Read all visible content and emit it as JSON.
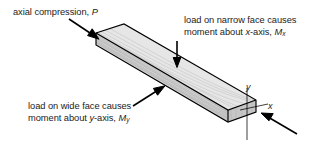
{
  "figure": {
    "background_color": "#ffffff",
    "line_color": "#000000",
    "top_face_color": "#e3e3e3",
    "front_face_color": "#d2d2d2",
    "end_face_color": "#c4c4c4",
    "grain_color": "#9a9a9a"
  },
  "labels": {
    "axial": {
      "line1_pre": "axial compression, ",
      "symbol": "P"
    },
    "narrow_face": {
      "line1": "load on narrow face causes",
      "line2_pre": "moment about ",
      "line2_axis": "x",
      "line2_mid": "-axis, ",
      "line2_symbol": "M",
      "line2_sub": "x"
    },
    "wide_face": {
      "line1": "load on wide face causes",
      "line2_pre": "moment about ",
      "line2_axis": "y",
      "line2_mid": "-axis, ",
      "line2_symbol": "M",
      "line2_sub": "y"
    },
    "axes": {
      "y_label": "y",
      "x_label": "x"
    }
  },
  "arrows": [
    {
      "name": "axial-compression-arrow",
      "from": [
        69,
        19
      ],
      "to": [
        98,
        38
      ]
    },
    {
      "name": "narrow-face-load-arrow",
      "from": [
        177,
        41
      ],
      "to": [
        177,
        67
      ]
    },
    {
      "name": "wide-face-load-arrow",
      "from": [
        133,
        106
      ],
      "to": [
        164,
        86
      ]
    },
    {
      "name": "end-axial-arrow",
      "from": [
        297,
        134
      ],
      "to": [
        261,
        113
      ]
    }
  ]
}
